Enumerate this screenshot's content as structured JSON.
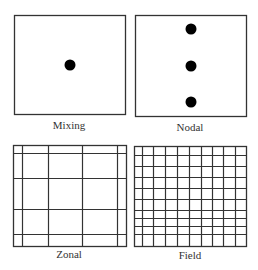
{
  "colors": {
    "stroke": "#333333",
    "dot": "#000000",
    "background": "#ffffff"
  },
  "panels": [
    {
      "id": "mixing",
      "label": "Mixing",
      "box": {
        "x": 14,
        "y": 15,
        "w": 111,
        "h": 99
      },
      "label_pos": {
        "x": 69,
        "y": 129
      },
      "dots": [
        {
          "cx": 70,
          "cy": 65
        }
      ],
      "vlines": [],
      "hlines": []
    },
    {
      "id": "nodal",
      "label": "Nodal",
      "box": {
        "x": 135,
        "y": 15,
        "w": 111,
        "h": 101
      },
      "label_pos": {
        "x": 190,
        "y": 131
      },
      "dots": [
        {
          "cx": 191,
          "cy": 29
        },
        {
          "cx": 191,
          "cy": 66
        },
        {
          "cx": 191,
          "cy": 102
        }
      ],
      "vlines": [],
      "hlines": []
    },
    {
      "id": "zonal",
      "label": "Zonal",
      "box": {
        "x": 13,
        "y": 145,
        "w": 113,
        "h": 101
      },
      "label_pos": {
        "x": 69,
        "y": 258
      },
      "dots": [],
      "vlines": [
        22,
        48,
        82,
        117
      ],
      "hlines": [
        153,
        178,
        209,
        234
      ]
    },
    {
      "id": "field",
      "label": "Field",
      "box": {
        "x": 134,
        "y": 146,
        "w": 112,
        "h": 100
      },
      "label_pos": {
        "x": 190,
        "y": 259
      },
      "dots": [],
      "vlines": [
        142,
        153,
        165,
        177,
        189,
        201,
        212,
        223,
        235
      ],
      "hlines": [
        155,
        166,
        177,
        188,
        199,
        210,
        218,
        226,
        234
      ]
    }
  ],
  "labels": {
    "mixing": "Mixing",
    "nodal": "Nodal",
    "zonal": "Zonal",
    "field": "Field"
  }
}
